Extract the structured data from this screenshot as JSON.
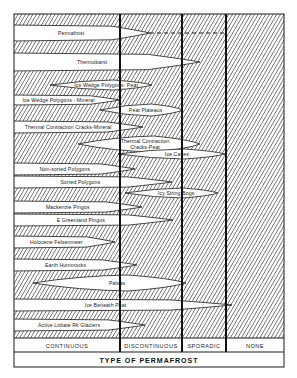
{
  "figure": {
    "title": "TYPE OF PERMAFROST",
    "categories": [
      {
        "label": "CONTINUOUS",
        "x0": 14,
        "x1": 120
      },
      {
        "label": "DISCONTINUOUS",
        "x0": 120,
        "x1": 182
      },
      {
        "label": "SPORADIC",
        "x0": 182,
        "x1": 226
      },
      {
        "label": "NONE",
        "x0": 226,
        "x1": 284
      }
    ],
    "features": [
      {
        "label": "Permafrost",
        "x0": 14,
        "x1": 150,
        "y": 33,
        "h": 8,
        "dashed_to": 226
      },
      {
        "label": "Thermokarst",
        "x0": 14,
        "x1": 200,
        "y": 62,
        "h": 9
      },
      {
        "label": "Ice Wedge Polygons- Peat",
        "x0": 50,
        "x1": 152,
        "y": 85,
        "h": 5
      },
      {
        "label": "Ice Wedge Polygons - Mineral",
        "x0": 14,
        "x1": 120,
        "y": 100,
        "h": 5
      },
      {
        "label": "Peat Plateaus",
        "x0": 100,
        "x1": 183,
        "y": 110,
        "h": 6
      },
      {
        "label": "Thermal Contraction Cracks-Mineral",
        "x0": 14,
        "x1": 143,
        "y": 127,
        "h": 6
      },
      {
        "label": "Thermal Contraction Cracks-Peat",
        "x0": 78,
        "x1": 200,
        "y": 144,
        "h": 8
      },
      {
        "label": "Ice Caves",
        "x0": 118,
        "x1": 225,
        "y": 154,
        "h": 5
      },
      {
        "label": "Non-sorted Polygons",
        "x0": 14,
        "x1": 135,
        "y": 169,
        "h": 6
      },
      {
        "label": "Sorted Polygons",
        "x0": 14,
        "x1": 172,
        "y": 182,
        "h": 6
      },
      {
        "label": "Icy String Bogs",
        "x0": 125,
        "x1": 218,
        "y": 193,
        "h": 5
      },
      {
        "label": "Mackenzie Pingos",
        "x0": 14,
        "x1": 142,
        "y": 207,
        "h": 6
      },
      {
        "label": "E Greenland Pingos",
        "x0": 14,
        "x1": 173,
        "y": 220,
        "h": 6
      },
      {
        "label": "Holocene Felsenmeer",
        "x0": 14,
        "x1": 115,
        "y": 242,
        "h": 6
      },
      {
        "label": "Earth Hummocks",
        "x0": 14,
        "x1": 137,
        "y": 265,
        "h": 6
      },
      {
        "label": "Palsas",
        "x0": 33,
        "x1": 186,
        "y": 283,
        "h": 8
      },
      {
        "label": "Ice Beneath Peat",
        "x0": 14,
        "x1": 232,
        "y": 305,
        "h": 6
      },
      {
        "label": "Active Lobate Rk Glaciers",
        "x0": 14,
        "x1": 145,
        "y": 325,
        "h": 6
      }
    ],
    "colors": {
      "ink": "#1a1a1a",
      "paper": "#ffffff",
      "hatch": "#2a2a2a"
    }
  }
}
